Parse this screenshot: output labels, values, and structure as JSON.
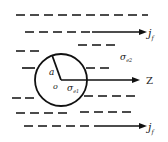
{
  "diagram": {
    "labels": {
      "radius": "a",
      "origin": "o",
      "sigma_inner": "σ",
      "sigma_inner_sub": "e1",
      "sigma_outer": "σ",
      "sigma_outer_sub": "e2",
      "axis": "Z",
      "current_top": "j",
      "current_top_sub": "f",
      "current_bottom": "j",
      "current_bottom_sub": "f"
    },
    "colors": {
      "stroke": "#111111",
      "background": "#ffffff"
    }
  }
}
